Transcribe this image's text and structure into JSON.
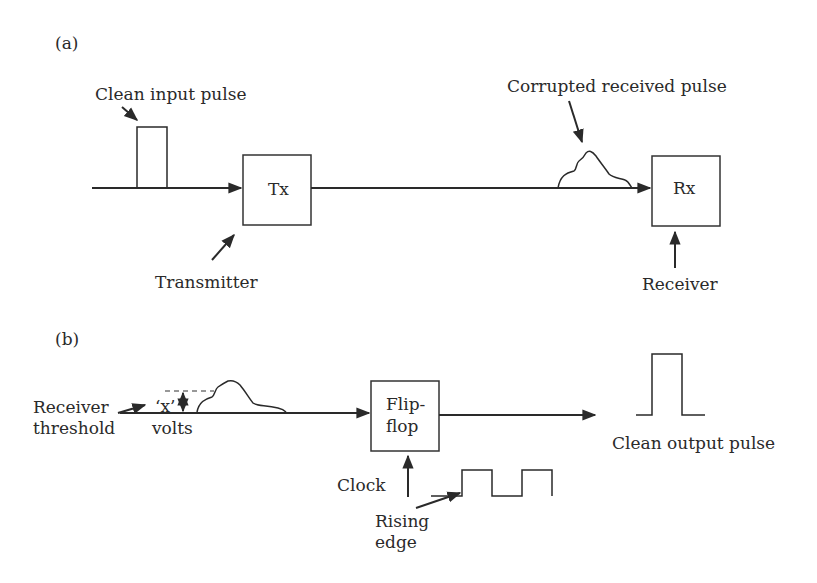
{
  "panel_a": {
    "label": "(a)",
    "input_pulse_label": "Clean input pulse",
    "tx_label": "Tx",
    "transmitter_label": "Transmitter",
    "corrupted_label": "Corrupted received pulse",
    "rx_label": "Rx",
    "receiver_label": "Receiver"
  },
  "panel_b": {
    "label": "(b)",
    "threshold_label_line1": "Receiver",
    "threshold_label_line2": "threshold",
    "x_label": "‘x’",
    "volts_label": "volts",
    "flipflop_line1": "Flip-",
    "flipflop_line2": "flop",
    "clock_label": "Clock",
    "rising_line1": "Rising",
    "rising_line2": "edge",
    "output_label": "Clean output pulse"
  },
  "colors": {
    "stroke": "#2a2a2a",
    "background": "#ffffff"
  }
}
